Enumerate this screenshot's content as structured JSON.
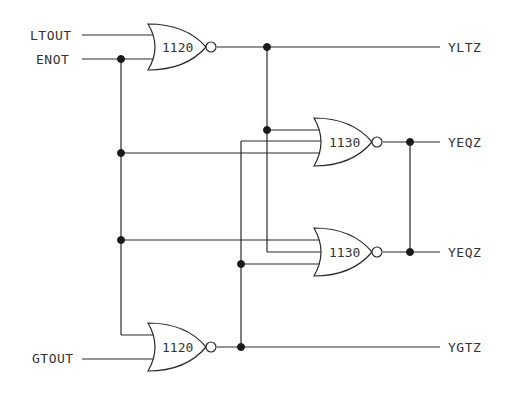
{
  "diagram": {
    "type": "logic-schematic",
    "inputs": [
      {
        "id": "LTOUT",
        "label": "LTOUT"
      },
      {
        "id": "ENOT",
        "label": "ENOT"
      },
      {
        "id": "GTOUT",
        "label": "GTOUT"
      }
    ],
    "outputs": [
      {
        "id": "YLTZ",
        "label": "YLTZ"
      },
      {
        "id": "YEQZ_1",
        "label": "YEQZ"
      },
      {
        "id": "YEQZ_2",
        "label": "YEQZ"
      },
      {
        "id": "YGTZ",
        "label": "YGTZ"
      }
    ],
    "gates": [
      {
        "id": "g_top",
        "type": "NOR",
        "label": "1120",
        "inputs": [
          "LTOUT",
          "ENOT"
        ],
        "output": "YLTZ"
      },
      {
        "id": "g_mid1",
        "type": "NOR",
        "label": "1130",
        "inputs": [
          "YLTZ",
          "YGTZ",
          "ENOT"
        ],
        "output": "YEQZ"
      },
      {
        "id": "g_mid2",
        "type": "NOR",
        "label": "1130",
        "inputs": [
          "ENOT",
          "YLTZ",
          "YGTZ"
        ],
        "output": "YEQZ"
      },
      {
        "id": "g_bot",
        "type": "NOR",
        "label": "1120",
        "inputs": [
          "ENOT",
          "GTOUT"
        ],
        "output": "YGTZ"
      }
    ]
  }
}
